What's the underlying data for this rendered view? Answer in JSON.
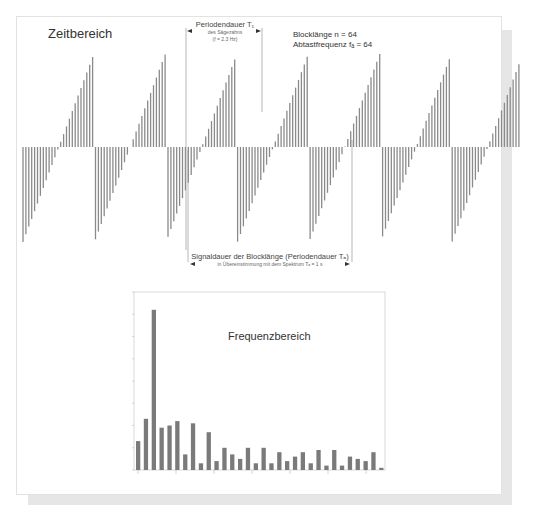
{
  "time_domain": {
    "title": "Zeitbereich",
    "period_label": {
      "line1": "Periodendauer  T₁",
      "line2": "des Sägezahns",
      "line3": "(f = 2.3 Hz)"
    },
    "block_info": {
      "line1": "Blocklänge n = 64",
      "line2": "Abtastfrequenz fₐ = 64"
    },
    "signal_label": {
      "line1": "Signaldauer der Blocklänge (Periodendauer Tₐ)",
      "line2": "in Übereinstimmung mit dem Spektrum Tₐ = 1 s"
    }
  },
  "frequency_domain": {
    "title": "Frequenzbereich"
  },
  "chart_data": [
    {
      "type": "bar",
      "title": "Zeitbereich",
      "description": "Sampled sawtooth signal, block length n = 64, sampling frequency 64, sawtooth frequency 2.3 Hz; vertical sample lines around zero baseline",
      "xlabel": "",
      "ylabel": "",
      "grid": false
    },
    {
      "type": "bar",
      "title": "Frequenzbereich",
      "x": [
        0,
        1,
        2,
        3,
        4,
        5,
        6,
        7,
        8,
        9,
        10,
        11,
        12,
        13,
        14,
        15,
        16,
        17,
        18,
        19,
        20,
        21,
        22,
        23,
        24,
        25,
        26,
        27,
        28,
        29,
        30,
        31
      ],
      "values": [
        0.13,
        0.23,
        0.72,
        0.19,
        0.2,
        0.22,
        0.07,
        0.21,
        0.03,
        0.17,
        0.04,
        0.1,
        0.07,
        0.05,
        0.1,
        0.03,
        0.1,
        0.03,
        0.08,
        0.04,
        0.06,
        0.08,
        0.03,
        0.09,
        0.02,
        0.09,
        0.02,
        0.06,
        0.05,
        0.04,
        0.08,
        0.01
      ],
      "ylim": [
        0,
        0.8
      ],
      "xlabel": "Hz",
      "ylabel": "",
      "grid": false,
      "note": "tick labels illegible at screenshot resolution"
    }
  ]
}
